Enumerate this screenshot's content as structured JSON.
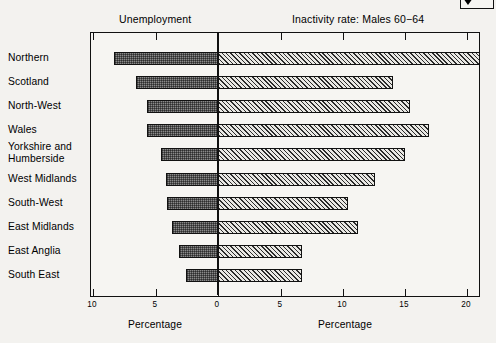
{
  "corner_control": {
    "icon": "triangle-down-icon"
  },
  "headers": {
    "left": "Unemployment",
    "right": "Inactivity rate:  Males 60−64"
  },
  "axis": {
    "left_caption": "Percentage",
    "right_caption": "Percentage",
    "ticks": [
      {
        "label": "10",
        "value": -10,
        "x": 92
      },
      {
        "label": "5",
        "value": -5,
        "x": 155
      },
      {
        "label": "0",
        "value": 0,
        "x": 217
      },
      {
        "label": "5",
        "value": 5,
        "x": 280
      },
      {
        "label": "10",
        "value": 10,
        "x": 342
      },
      {
        "label": "15",
        "value": 15,
        "x": 404
      },
      {
        "label": "20",
        "value": 20,
        "x": 466
      }
    ]
  },
  "chart_data": {
    "type": "bar",
    "orientation": "horizontal",
    "layout": "diverging-pyramid",
    "title": "",
    "xlabel": "Percentage",
    "ylabel": "",
    "grid": false,
    "legend": [
      "Unemployment",
      "Inactivity rate:  Males 60−64"
    ],
    "xlim_left": [
      10,
      0
    ],
    "xlim_right": [
      0,
      21.5
    ],
    "categories": [
      "Northern",
      "Scotland",
      "North-West",
      "Wales",
      "Yorkshire and\nHumberside",
      "West Midlands",
      "South-West",
      "East Midlands",
      "East Anglia",
      "South East"
    ],
    "series": [
      {
        "name": "Unemployment",
        "side": "left",
        "values": [
          8.3,
          6.6,
          5.7,
          5.7,
          4.6,
          4.2,
          4.1,
          3.7,
          3.1,
          2.6
        ]
      },
      {
        "name": "Inactivity rate:  Males 60−64",
        "side": "right",
        "values": [
          21.0,
          14.0,
          15.4,
          16.9,
          15.0,
          12.6,
          10.4,
          11.2,
          6.7,
          6.7
        ]
      }
    ]
  }
}
